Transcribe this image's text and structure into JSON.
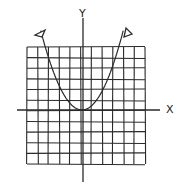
{
  "diagram": {
    "type": "hand-drawn coordinate graph",
    "x_axis_label": "X",
    "y_axis_label": "Y",
    "grid": {
      "columns": 11,
      "rows": 11
    },
    "curve": {
      "kind": "parabola",
      "opens": "up",
      "vertex": "origin",
      "arrows_on_ends": true
    },
    "colors": {
      "ink": "#2a2a2a",
      "background": "#ffffff"
    }
  }
}
